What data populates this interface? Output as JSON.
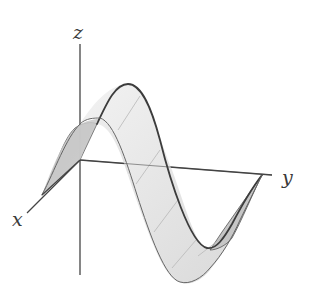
{
  "figure": {
    "axes": {
      "x_label": "x",
      "y_label": "y",
      "z_label": "z"
    },
    "colors": {
      "axis": "#444444",
      "surface_fill": "#e6e6e6",
      "surface_shadow": "#c4c4c4",
      "edge": "#3c3c3c",
      "grid": "#b8b8b8",
      "background": "#ffffff"
    }
  }
}
